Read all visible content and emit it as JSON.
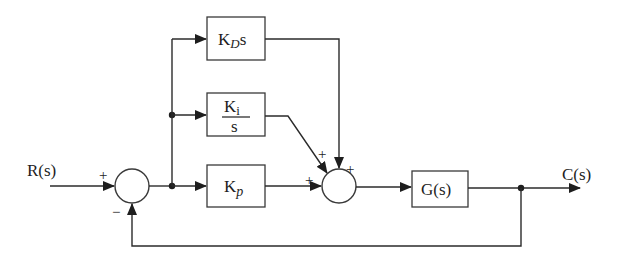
{
  "diagram": {
    "type": "block-diagram",
    "input": {
      "label": "R(s)"
    },
    "output": {
      "label": "C(s)"
    },
    "blocks": {
      "derivative": {
        "main": "K",
        "sub": "D",
        "suffix": "s"
      },
      "integral": {
        "num_main": "K",
        "num_sub": "i",
        "den": "s"
      },
      "proportional": {
        "main": "K",
        "sub": "p"
      },
      "plant": {
        "label": "G(s)"
      }
    },
    "summing_junctions": {
      "error": {
        "input_sign": "+",
        "feedback_sign": "−"
      },
      "controller": {
        "integral_sign": "+",
        "derivative_sign": "+",
        "proportional_sign": "+"
      }
    },
    "colors": {
      "line": "#2b2b2b",
      "background": "#ffffff"
    }
  }
}
